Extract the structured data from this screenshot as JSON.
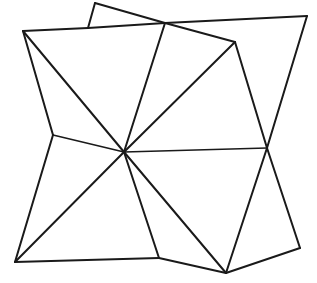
{
  "figure": {
    "width": 317,
    "height": 283,
    "background_color": "#ffffff",
    "stroke_color": "#1a1a1a",
    "stroke_width": 2.0,
    "thin_stroke_width": 1.6,
    "points": {
      "hub": {
        "name": "center-hub",
        "x": 124,
        "y": 152
      },
      "top_left_corner": {
        "name": "top-left-corner",
        "x": 23,
        "y": 31
      },
      "top_peak": {
        "name": "top-small-peak",
        "x": 95,
        "y": 3
      },
      "top_peak_foot": {
        "name": "top-peak-foot",
        "x": 88,
        "y": 28
      },
      "top_cross": {
        "name": "top-crossing-node",
        "x": 165,
        "y": 23
      },
      "top_right_corner": {
        "name": "top-right-corner",
        "x": 307,
        "y": 16
      },
      "upper_right_node": {
        "name": "upper-right-node",
        "x": 235,
        "y": 42
      },
      "left_edge_node": {
        "name": "left-edge-node",
        "x": 53,
        "y": 135
      },
      "right_cross": {
        "name": "right-crossing-node",
        "x": 267,
        "y": 148
      },
      "bottom_left_corner": {
        "name": "bottom-left-corner",
        "x": 15,
        "y": 262
      },
      "bottom_edge_node": {
        "name": "bottom-edge-node",
        "x": 159,
        "y": 258
      },
      "bottom_apex": {
        "name": "bottom-apex-node",
        "x": 226,
        "y": 273
      },
      "bottom_right_corner": {
        "name": "bottom-right-corner",
        "x": 300,
        "y": 248
      }
    },
    "edges": [
      {
        "name": "edge-top-left-to-peak-foot",
        "from": "top_left_corner",
        "to": "top_peak_foot",
        "weight": "normal"
      },
      {
        "name": "edge-peak-foot-to-top-cross",
        "from": "top_peak_foot",
        "to": "top_cross",
        "weight": "normal"
      },
      {
        "name": "edge-peak-foot-to-peak",
        "from": "top_peak_foot",
        "to": "top_peak",
        "weight": "normal"
      },
      {
        "name": "edge-peak-to-top-cross",
        "from": "top_peak",
        "to": "top_cross",
        "weight": "normal"
      },
      {
        "name": "edge-top-cross-to-top-right",
        "from": "top_cross",
        "to": "top_right_corner",
        "weight": "normal"
      },
      {
        "name": "edge-top-right-to-right-cross",
        "from": "top_right_corner",
        "to": "right_cross",
        "weight": "normal"
      },
      {
        "name": "edge-right-cross-to-bottom-right",
        "from": "right_cross",
        "to": "bottom_right_corner",
        "weight": "normal"
      },
      {
        "name": "edge-bottom-right-to-bottom-apex",
        "from": "bottom_right_corner",
        "to": "bottom_apex",
        "weight": "normal"
      },
      {
        "name": "edge-bottom-apex-to-bottom-edge-node",
        "from": "bottom_apex",
        "to": "bottom_edge_node",
        "weight": "normal"
      },
      {
        "name": "edge-bottom-edge-node-to-bottom-left",
        "from": "bottom_edge_node",
        "to": "bottom_left_corner",
        "weight": "normal"
      },
      {
        "name": "edge-bottom-left-to-left-edge-node",
        "from": "bottom_left_corner",
        "to": "left_edge_node",
        "weight": "normal"
      },
      {
        "name": "edge-left-edge-node-to-top-left",
        "from": "left_edge_node",
        "to": "top_left_corner",
        "weight": "normal"
      },
      {
        "name": "edge-top-cross-to-upper-right-node",
        "from": "top_cross",
        "to": "upper_right_node",
        "weight": "normal"
      },
      {
        "name": "edge-upper-right-node-to-right-cross",
        "from": "upper_right_node",
        "to": "right_cross",
        "weight": "normal"
      },
      {
        "name": "edge-right-cross-to-bottom-apex",
        "from": "right_cross",
        "to": "bottom_apex",
        "weight": "normal"
      },
      {
        "name": "spoke-hub-to-top-left",
        "from": "hub",
        "to": "top_left_corner",
        "weight": "normal"
      },
      {
        "name": "spoke-hub-to-top-cross",
        "from": "hub",
        "to": "top_cross",
        "weight": "normal"
      },
      {
        "name": "spoke-hub-to-upper-right-node",
        "from": "hub",
        "to": "upper_right_node",
        "weight": "normal"
      },
      {
        "name": "spoke-hub-to-right-cross",
        "from": "hub",
        "to": "right_cross",
        "weight": "thin"
      },
      {
        "name": "spoke-hub-to-bottom-apex",
        "from": "hub",
        "to": "bottom_apex",
        "weight": "normal"
      },
      {
        "name": "spoke-hub-to-bottom-edge-node",
        "from": "hub",
        "to": "bottom_edge_node",
        "weight": "normal"
      },
      {
        "name": "spoke-hub-to-bottom-left",
        "from": "hub",
        "to": "bottom_left_corner",
        "weight": "normal"
      },
      {
        "name": "spoke-hub-to-left-edge-node",
        "from": "hub",
        "to": "left_edge_node",
        "weight": "thin"
      }
    ]
  }
}
